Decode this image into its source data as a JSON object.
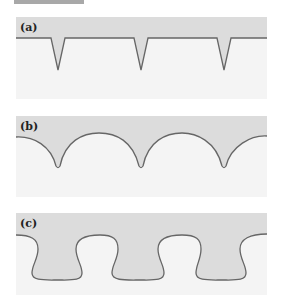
{
  "figure": {
    "panels": [
      {
        "label": "(a)",
        "shape": "v-notch",
        "description": "sharp V-shaped notches"
      },
      {
        "label": "(b)",
        "shape": "cusp",
        "description": "rounded arcs meeting in cusps"
      },
      {
        "label": "(c)",
        "shape": "bulb",
        "description": "bulbous rounded lobes"
      }
    ],
    "colors": {
      "fill": "#dcdcdc",
      "panel_bg": "#f4f4f4",
      "line": "#666666"
    }
  }
}
